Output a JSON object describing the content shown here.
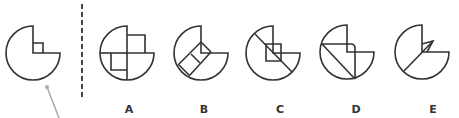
{
  "puzzle": {
    "stroke_color": "#333333",
    "pointer_color": "#aaaaaa",
    "divider_color": "#444444",
    "radius": 27,
    "reference": {
      "center": [
        33,
        53
      ],
      "extra_paths": [
        "M33,43 L43,43 L43,53"
      ]
    },
    "options": [
      {
        "label": "A",
        "center": [
          127,
          53
        ],
        "extra_paths": [
          "M127,35 L145,35 L145,53",
          "M111,53 L111,70 L127,70",
          "M127,53 L127,80",
          "M100,53 L127,53"
        ]
      },
      {
        "label": "B",
        "center": [
          201,
          53
        ],
        "extra_paths": [
          "M201,42 L211,52",
          "M201,42 L178,65",
          "M211,52 L190,75",
          "M191,54 L200,63",
          "M179,65 L190,76"
        ]
      },
      {
        "label": "C",
        "center": [
          273,
          53
        ],
        "extra_paths": [
          "M266,44 L281,44 L281,61 L266,61 Z",
          "M255,34 L292,72"
        ]
      },
      {
        "label": "D",
        "center": [
          347,
          52
        ],
        "extra_paths": [
          "M322,44 L351,44 Q355,44 355,48 L355,79",
          "M322,44 L355,79"
        ]
      },
      {
        "label": "E",
        "center": [
          422,
          52
        ],
        "extra_paths": [
          "M422,44 L433,41 L427,52",
          "M433,41 L404,71"
        ]
      }
    ]
  }
}
